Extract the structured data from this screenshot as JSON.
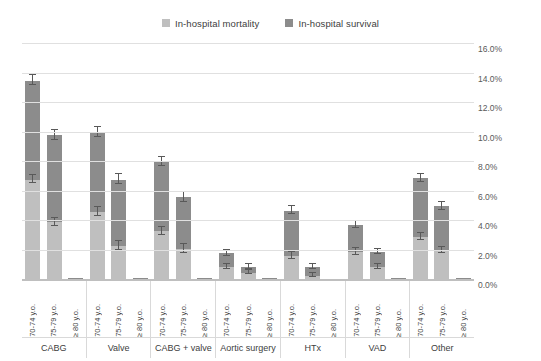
{
  "legend": {
    "position": "top-center",
    "items": [
      {
        "label": "In-hospital mortality",
        "color": "#bfbfbf"
      },
      {
        "label": "In-hospital survival",
        "color": "#8c8c8c"
      }
    ]
  },
  "yaxis": {
    "ticks": [
      "0.0%",
      "2.0%",
      "4.0%",
      "6.0%",
      "8.0%",
      "10.0%",
      "12.0%",
      "14.0%",
      "16.0%"
    ],
    "position": "right"
  },
  "chart_data": {
    "type": "bar",
    "title": "",
    "xlabel": "",
    "ylabel": "",
    "ylim": [
      0,
      16
    ],
    "ytick_values": [
      0,
      2,
      4,
      6,
      8,
      10,
      12,
      14,
      16
    ],
    "grid": true,
    "stacked": true,
    "categories": [
      "CABG",
      "Valve",
      "CABG + valve",
      "Aortic surgery",
      "HTx",
      "VAD",
      "Other"
    ],
    "subcategories": [
      "70-74 y.o.",
      "75-79 y.o.",
      "≥ 80 y.o."
    ],
    "series": [
      {
        "name": "In-hospital mortality",
        "color": "#bfbfbf",
        "values": [
          [
            6.8,
            3.9,
            0.05
          ],
          [
            4.6,
            2.3,
            0.05
          ],
          [
            3.3,
            2.1,
            0.05
          ],
          [
            0.9,
            0.5,
            0.05
          ],
          [
            1.6,
            0.3,
            0.0
          ],
          [
            1.9,
            0.9,
            0.05
          ],
          [
            2.9,
            2.0,
            0.05
          ]
        ],
        "errors": [
          [
            0.25,
            0.25,
            0.05
          ],
          [
            0.25,
            0.25,
            0.05
          ],
          [
            0.25,
            0.25,
            0.05
          ],
          [
            0.15,
            0.12,
            0.03
          ],
          [
            0.2,
            0.1,
            0.0
          ],
          [
            0.2,
            0.15,
            0.03
          ],
          [
            0.2,
            0.2,
            0.03
          ]
        ]
      },
      {
        "name": "In-hospital survival",
        "color": "#8c8c8c",
        "values": [
          [
            6.7,
            5.9,
            0.1
          ],
          [
            5.4,
            4.5,
            0.1
          ],
          [
            4.7,
            3.5,
            0.1
          ],
          [
            0.9,
            0.4,
            0.07
          ],
          [
            3.1,
            0.6,
            0.0
          ],
          [
            1.8,
            1.0,
            0.07
          ],
          [
            4.0,
            3.0,
            0.1
          ]
        ],
        "errors": [
          [
            0.3,
            0.3,
            0.05
          ],
          [
            0.3,
            0.3,
            0.05
          ],
          [
            0.3,
            0.3,
            0.05
          ],
          [
            0.15,
            0.12,
            0.03
          ],
          [
            0.25,
            0.12,
            0.0
          ],
          [
            0.2,
            0.15,
            0.03
          ],
          [
            0.25,
            0.25,
            0.03
          ]
        ]
      }
    ],
    "totals": [
      [
        13.5,
        9.8,
        0.15
      ],
      [
        10.0,
        6.8,
        0.15
      ],
      [
        8.0,
        5.6,
        0.15
      ],
      [
        1.8,
        0.9,
        0.12
      ],
      [
        4.7,
        0.9,
        0.0
      ],
      [
        3.7,
        1.9,
        0.12
      ],
      [
        6.9,
        5.0,
        0.15
      ]
    ]
  }
}
